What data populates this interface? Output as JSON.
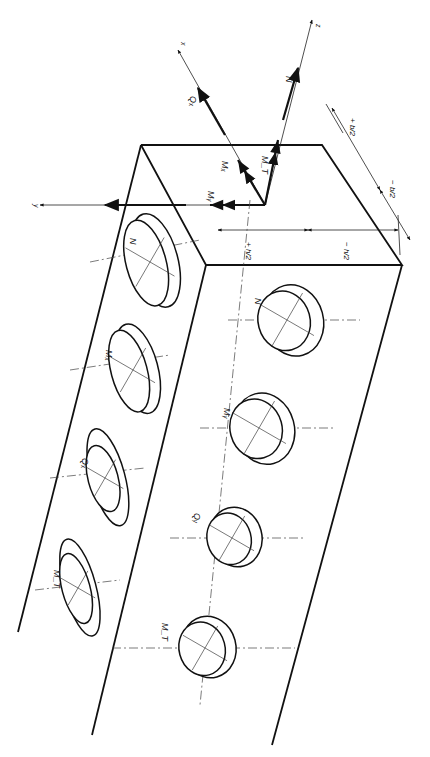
{
  "figure": {
    "orientation": "rotated-90-clockwise",
    "line_color": "#111111",
    "background": "#ffffff"
  },
  "axes": {
    "x": "x",
    "y": "y",
    "z": "z"
  },
  "section_forces": {
    "N": "N",
    "Qx": "Qₓ",
    "Mx": "Mₓ",
    "My": "Mᵧ",
    "MT": "M_T"
  },
  "dimensions": {
    "b_plus": "+ b/2",
    "b_minus": "− b/2",
    "h_plus": "+ h/2",
    "h_minus": "− h/2",
    "b_frac_num": "b",
    "b_frac_den": "2",
    "h_frac_num": "h",
    "h_frac_den": "2",
    "plus": "+",
    "minus": "−"
  },
  "top_face_diagrams": [
    {
      "label": "N",
      "cx": 150,
      "cy": 262
    },
    {
      "label": "Mₓ",
      "cx": 133,
      "cy": 370
    },
    {
      "label": "Qₓ",
      "cx": 105,
      "cy": 478
    },
    {
      "label": "M_T",
      "cx": 78,
      "cy": 588
    }
  ],
  "side_face_diagrams": [
    {
      "label": "N",
      "cx": 287,
      "cy": 320
    },
    {
      "label": "Mᵧ",
      "cx": 259,
      "cy": 428
    },
    {
      "label": "Qᵧ",
      "cx": 232,
      "cy": 538
    },
    {
      "label": "M_T",
      "cx": 205,
      "cy": 648
    }
  ]
}
